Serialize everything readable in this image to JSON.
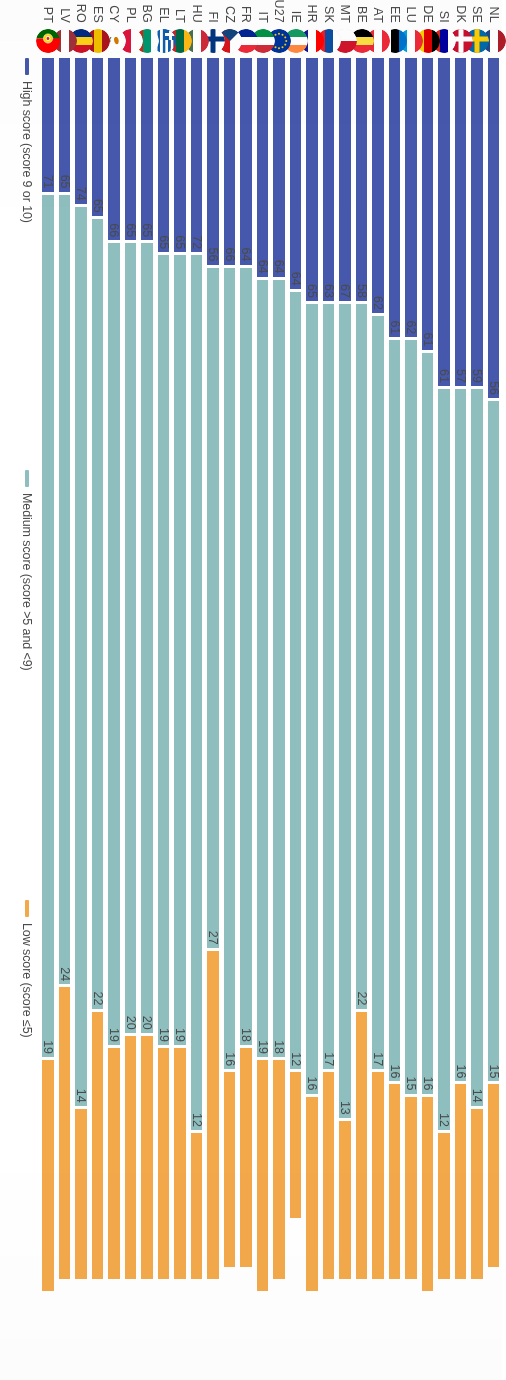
{
  "legend": {
    "items": [
      {
        "key": "high",
        "label": "High score (score 9 or 10)",
        "color": "#4558ac"
      },
      {
        "key": "medium",
        "label": "Medium score (score >5 and <9)",
        "color": "#8fbebe"
      },
      {
        "key": "low",
        "label": "Low score (score ≤5)",
        "color": "#f3a94a"
      }
    ]
  },
  "chart_data": {
    "type": "bar",
    "orientation": "horizontal-stacked",
    "title": "",
    "xlabel": "",
    "ylabel": "",
    "xlim": [
      0,
      100
    ],
    "grid": false,
    "legend_position": "bottom-left",
    "categories": [
      "NL",
      "SE",
      "DK",
      "SI",
      "DE",
      "LU",
      "EE",
      "AT",
      "BE",
      "MT",
      "SK",
      "HR",
      "IE",
      "EU27",
      "IT",
      "FR",
      "CZ",
      "FI",
      "HU",
      "LT",
      "EL",
      "BG",
      "PL",
      "CY",
      "ES",
      "RO",
      "LV",
      "PT"
    ],
    "series": [
      {
        "name": "High score (score 9 or 10)",
        "color": "#4558ac",
        "values": [
          28,
          27,
          27,
          27,
          24,
          23,
          23,
          21,
          20,
          20,
          20,
          20,
          19,
          18,
          18,
          17,
          17,
          17,
          16,
          16,
          16,
          15,
          15,
          15,
          13,
          12,
          11,
          11
        ]
      },
      {
        "name": "Medium score (score >5 and <9)",
        "color": "#8fbebe",
        "values": [
          56,
          59,
          57,
          61,
          61,
          62,
          61,
          62,
          58,
          67,
          63,
          65,
          64,
          64,
          64,
          64,
          66,
          56,
          72,
          65,
          65,
          65,
          65,
          66,
          65,
          74,
          65,
          71
        ]
      },
      {
        "name": "Low score (score ≤5)",
        "color": "#f3a94a",
        "values": [
          15,
          14,
          16,
          12,
          16,
          15,
          16,
          17,
          22,
          13,
          17,
          16,
          12,
          18,
          19,
          18,
          16,
          27,
          12,
          19,
          19,
          20,
          20,
          19,
          22,
          14,
          24,
          19
        ]
      }
    ],
    "rows": [
      {
        "code": "NL",
        "high": 28,
        "medium": 56,
        "low": 15
      },
      {
        "code": "SE",
        "high": 27,
        "medium": 59,
        "low": 14
      },
      {
        "code": "DK",
        "high": 27,
        "medium": 57,
        "low": 16
      },
      {
        "code": "SI",
        "high": 27,
        "medium": 61,
        "low": 12
      },
      {
        "code": "DE",
        "high": 24,
        "medium": 61,
        "low": 16
      },
      {
        "code": "LU",
        "high": 23,
        "medium": 62,
        "low": 15
      },
      {
        "code": "EE",
        "high": 23,
        "medium": 61,
        "low": 16
      },
      {
        "code": "AT",
        "high": 21,
        "medium": 62,
        "low": 17
      },
      {
        "code": "BE",
        "high": 20,
        "medium": 58,
        "low": 22
      },
      {
        "code": "MT",
        "high": 20,
        "medium": 67,
        "low": 13
      },
      {
        "code": "SK",
        "high": 20,
        "medium": 63,
        "low": 17
      },
      {
        "code": "HR",
        "high": 20,
        "medium": 65,
        "low": 16
      },
      {
        "code": "IE",
        "high": 19,
        "medium": 64,
        "low": 12
      },
      {
        "code": "EU27",
        "high": 18,
        "medium": 64,
        "low": 18
      },
      {
        "code": "IT",
        "high": 18,
        "medium": 64,
        "low": 19
      },
      {
        "code": "FR",
        "high": 17,
        "medium": 64,
        "low": 18
      },
      {
        "code": "CZ",
        "high": 17,
        "medium": 66,
        "low": 16
      },
      {
        "code": "FI",
        "high": 17,
        "medium": 56,
        "low": 27
      },
      {
        "code": "HU",
        "high": 16,
        "medium": 72,
        "low": 12
      },
      {
        "code": "LT",
        "high": 16,
        "medium": 65,
        "low": 19
      },
      {
        "code": "EL",
        "high": 16,
        "medium": 65,
        "low": 19
      },
      {
        "code": "BG",
        "high": 15,
        "medium": 65,
        "low": 20
      },
      {
        "code": "PL",
        "high": 15,
        "medium": 65,
        "low": 20
      },
      {
        "code": "CY",
        "high": 15,
        "medium": 66,
        "low": 19
      },
      {
        "code": "ES",
        "high": 13,
        "medium": 65,
        "low": 22
      },
      {
        "code": "RO",
        "high": 12,
        "medium": 74,
        "low": 14
      },
      {
        "code": "LV",
        "high": 11,
        "medium": 65,
        "low": 24
      },
      {
        "code": "PT",
        "high": 11,
        "medium": 71,
        "low": 19
      }
    ]
  }
}
